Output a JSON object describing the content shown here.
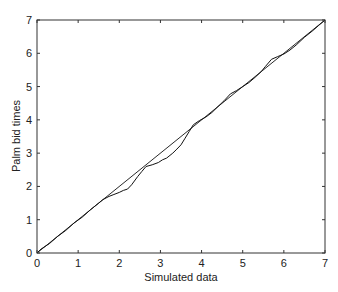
{
  "chart_data": {
    "type": "line",
    "title": "",
    "xlabel": "Simulated data",
    "ylabel": "Palm bid times",
    "xlim": [
      0,
      7
    ],
    "ylim": [
      0,
      7
    ],
    "xticks": [
      0,
      1,
      2,
      3,
      4,
      5,
      6,
      7
    ],
    "yticks": [
      0,
      1,
      2,
      3,
      4,
      5,
      6,
      7
    ],
    "grid": false,
    "legend": null,
    "series": [
      {
        "name": "Reference line (y = x)",
        "style": "solid-thin",
        "x": [
          0,
          7
        ],
        "y": [
          0,
          7
        ]
      },
      {
        "name": "Quantile-quantile curve",
        "style": "jagged",
        "x": [
          0,
          0.1,
          0.3,
          0.5,
          0.7,
          0.9,
          1.1,
          1.3,
          1.5,
          1.6,
          1.75,
          1.85,
          2.0,
          2.1,
          2.2,
          2.3,
          2.45,
          2.55,
          2.65,
          2.8,
          2.95,
          3.05,
          3.15,
          3.3,
          3.4,
          3.5,
          3.6,
          3.7,
          3.8,
          3.95,
          4.1,
          4.25,
          4.4,
          4.55,
          4.7,
          4.85,
          5.0,
          5.15,
          5.3,
          5.45,
          5.55,
          5.7,
          5.85,
          6.0,
          6.15,
          6.3,
          6.5,
          6.7,
          6.85,
          7.0
        ],
        "y": [
          0,
          0.12,
          0.28,
          0.5,
          0.68,
          0.9,
          1.08,
          1.3,
          1.5,
          1.6,
          1.7,
          1.75,
          1.82,
          1.88,
          1.92,
          2.05,
          2.3,
          2.45,
          2.6,
          2.65,
          2.72,
          2.8,
          2.85,
          3.0,
          3.12,
          3.25,
          3.45,
          3.65,
          3.85,
          3.98,
          4.08,
          4.22,
          4.4,
          4.58,
          4.78,
          4.88,
          5.0,
          5.12,
          5.28,
          5.45,
          5.6,
          5.82,
          5.9,
          5.98,
          6.1,
          6.25,
          6.48,
          6.68,
          6.84,
          7.0
        ]
      }
    ]
  },
  "axes": {
    "x_tick_labels": [
      "0",
      "1",
      "2",
      "3",
      "4",
      "5",
      "6",
      "7"
    ],
    "y_tick_labels": [
      "0",
      "1",
      "2",
      "3",
      "4",
      "5",
      "6",
      "7"
    ],
    "xlabel": "Simulated data",
    "ylabel": "Palm bid times"
  },
  "colors": {
    "axis": "#333333",
    "line": "#111111",
    "background": "#ffffff"
  }
}
